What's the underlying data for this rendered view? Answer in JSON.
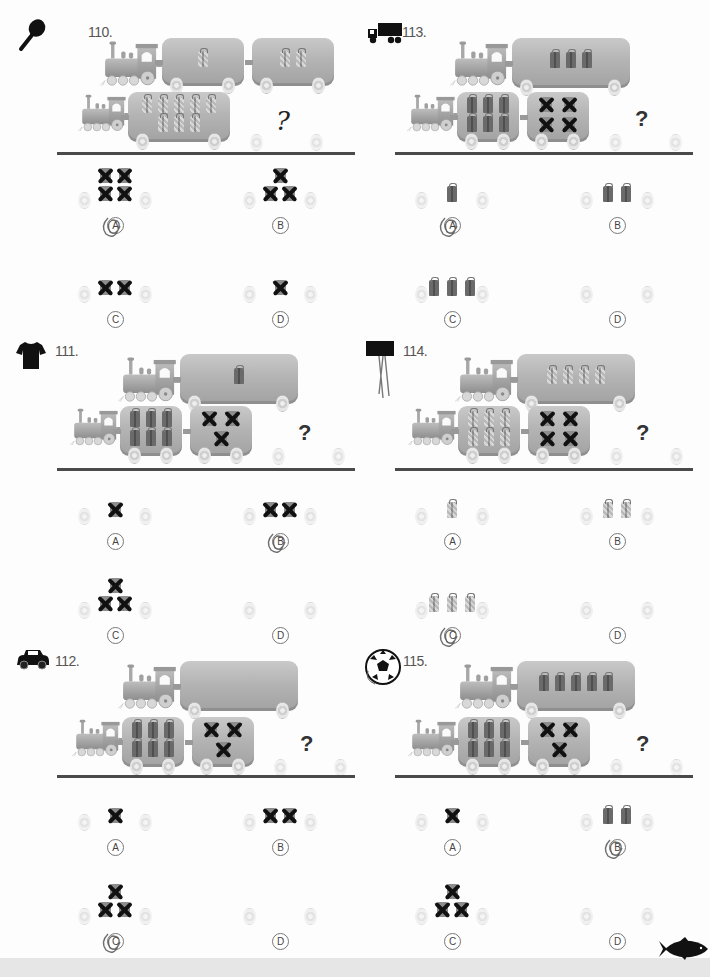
{
  "worksheet": {
    "puzzles": [
      {
        "number": "110.",
        "sticker_icon": "racket-icon",
        "top_train_cars": [
          {
            "cargo": "dotted-gift",
            "count": 1
          },
          {
            "cargo": "dotted-gift",
            "count": 2
          }
        ],
        "bottom_train_cars": [
          {
            "cargo": "dotted-gift",
            "count": 8
          }
        ],
        "question_mark": "?",
        "options": [
          {
            "label": "A",
            "items": "crossed-gift",
            "count": 4,
            "arrangement": "2x2",
            "marked": true
          },
          {
            "label": "B",
            "items": "crossed-gift",
            "count": 3,
            "arrangement": "triangle",
            "marked": false
          },
          {
            "label": "C",
            "items": "crossed-gift",
            "count": 2,
            "arrangement": "row",
            "marked": false
          },
          {
            "label": "D",
            "items": "crossed-gift",
            "count": 1,
            "arrangement": "single",
            "marked": false
          }
        ]
      },
      {
        "number": "113.",
        "sticker_icon": "truck-icon",
        "top_train_cars": [
          {
            "cargo": "dark-gift",
            "count": 3
          }
        ],
        "bottom_train_cars": [
          {
            "cargo": "dark-gift",
            "count": 6
          },
          {
            "cargo": "crossed-gift",
            "count": 4
          }
        ],
        "question_mark": "?",
        "options": [
          {
            "label": "A",
            "items": "dark-gift",
            "count": 1,
            "arrangement": "single",
            "marked": true
          },
          {
            "label": "B",
            "items": "dark-gift",
            "count": 2,
            "arrangement": "row",
            "marked": false
          },
          {
            "label": "C",
            "items": "dark-gift",
            "count": 3,
            "arrangement": "row",
            "marked": false
          },
          {
            "label": "D",
            "items": "empty",
            "count": 0,
            "arrangement": "none",
            "marked": false
          }
        ]
      },
      {
        "number": "111.",
        "sticker_icon": "tshirt-icon",
        "top_train_cars": [
          {
            "cargo": "dark-gift",
            "count": 1
          }
        ],
        "bottom_train_cars": [
          {
            "cargo": "dark-gift",
            "count": 6
          },
          {
            "cargo": "crossed-gift",
            "count": 3
          }
        ],
        "question_mark": "?",
        "options": [
          {
            "label": "A",
            "items": "crossed-gift",
            "count": 1,
            "arrangement": "single",
            "marked": false
          },
          {
            "label": "B",
            "items": "crossed-gift",
            "count": 2,
            "arrangement": "row",
            "marked": true
          },
          {
            "label": "C",
            "items": "crossed-gift",
            "count": 3,
            "arrangement": "triangle",
            "marked": false
          },
          {
            "label": "D",
            "items": "empty",
            "count": 0,
            "arrangement": "none",
            "marked": false
          }
        ]
      },
      {
        "number": "114.",
        "sticker_icon": "sign-icon",
        "top_train_cars": [
          {
            "cargo": "dotted-gift",
            "count": 4
          }
        ],
        "bottom_train_cars": [
          {
            "cargo": "dotted-gift",
            "count": 6
          },
          {
            "cargo": "crossed-gift",
            "count": 4
          }
        ],
        "question_mark": "?",
        "options": [
          {
            "label": "A",
            "items": "dotted-gift",
            "count": 1,
            "arrangement": "single",
            "marked": false
          },
          {
            "label": "B",
            "items": "dotted-gift",
            "count": 2,
            "arrangement": "row",
            "marked": false
          },
          {
            "label": "C",
            "items": "dotted-gift",
            "count": 3,
            "arrangement": "row",
            "marked": true
          },
          {
            "label": "D",
            "items": "empty",
            "count": 0,
            "arrangement": "none",
            "marked": false
          }
        ]
      },
      {
        "number": "112.",
        "sticker_icon": "car-icon",
        "top_train_cars": [
          {
            "cargo": "empty",
            "count": 0
          }
        ],
        "bottom_train_cars": [
          {
            "cargo": "dark-gift",
            "count": 6
          },
          {
            "cargo": "crossed-gift",
            "count": 3
          }
        ],
        "question_mark": "?",
        "options": [
          {
            "label": "A",
            "items": "crossed-gift",
            "count": 1,
            "arrangement": "single",
            "marked": false
          },
          {
            "label": "B",
            "items": "crossed-gift",
            "count": 2,
            "arrangement": "row",
            "marked": false
          },
          {
            "label": "C",
            "items": "crossed-gift",
            "count": 3,
            "arrangement": "triangle",
            "marked": true
          },
          {
            "label": "D",
            "items": "empty",
            "count": 0,
            "arrangement": "none",
            "marked": false
          }
        ]
      },
      {
        "number": "115.",
        "sticker_icon": "soccer-ball-icon",
        "top_train_cars": [
          {
            "cargo": "dark-gift",
            "count": 5
          }
        ],
        "bottom_train_cars": [
          {
            "cargo": "dark-gift",
            "count": 6
          },
          {
            "cargo": "crossed-gift",
            "count": 3
          }
        ],
        "question_mark": "?",
        "options": [
          {
            "label": "A",
            "items": "crossed-gift",
            "count": 1,
            "arrangement": "single",
            "marked": false
          },
          {
            "label": "B",
            "items": "dark-gift",
            "count": 2,
            "arrangement": "row",
            "marked": true
          },
          {
            "label": "C",
            "items": "crossed-gift",
            "count": 3,
            "arrangement": "triangle",
            "marked": false
          },
          {
            "label": "D",
            "items": "empty",
            "count": 0,
            "arrangement": "none",
            "marked": false
          }
        ]
      }
    ],
    "corner_sticker_icon": "fish-icon",
    "colors": {
      "ink": "#111111",
      "divider": "#4a4a4a",
      "car_gray": "#b4b4b4",
      "gift_dark": "#6a6a6a",
      "pencil": "#555555"
    }
  }
}
